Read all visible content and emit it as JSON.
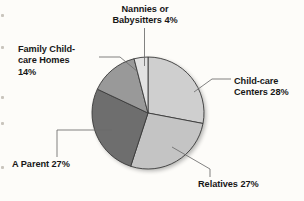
{
  "figure": {
    "background_color": "#fdfcf9",
    "text_color": "#171717",
    "slice_outline_color": "#3a3a3a",
    "leader_line_color": "#6b6b6b"
  },
  "labels": {
    "nannies": "Nannies or\nBabysitters 4%",
    "family_homes": "Family Child-\ncare Homes\n14%",
    "centers": "Child-care\nCenters 28%",
    "parent": "A Parent 27%",
    "relatives": "Relatives 27%"
  },
  "chart_data": {
    "type": "pie",
    "title": "",
    "subtitle": "",
    "xlabel": "",
    "ylabel": "",
    "legend": "none",
    "grid": false,
    "start_angle_deg": 0,
    "direction": "clockwise",
    "center": {
      "x": 148,
      "y": 113
    },
    "radius": 56,
    "labels": [
      "Child-care Centers",
      "Relatives",
      "A Parent",
      "Family Child-care Homes",
      "Nannies or Babysitters"
    ],
    "values": [
      28,
      27,
      27,
      14,
      4
    ],
    "value_unit": "percent",
    "data_labels": [
      "Child-care Centers 28%",
      "Relatives 27%",
      "A Parent 27%",
      "Family Child-care Homes 14%",
      "Nannies or Babysitters 4%"
    ],
    "slice_colors": [
      "#cfcfcf",
      "#c4c4c4",
      "#6e6e6e",
      "#999999",
      "#e2e2e2"
    ],
    "slices": [
      {
        "name": "Child-care Centers",
        "value": 28,
        "label": "Child-care Centers 28%",
        "color": "#cfcfcf",
        "start_deg": 0,
        "end_deg": 100.8
      },
      {
        "name": "Relatives",
        "value": 27,
        "label": "Relatives 27%",
        "color": "#c4c4c4",
        "start_deg": 100.8,
        "end_deg": 198.0
      },
      {
        "name": "A Parent",
        "value": 27,
        "label": "A Parent 27%",
        "color": "#6e6e6e",
        "start_deg": 198.0,
        "end_deg": 295.2
      },
      {
        "name": "Family Child-care Homes",
        "value": 14,
        "label": "Family Child-care Homes 14%",
        "color": "#999999",
        "start_deg": 295.2,
        "end_deg": 345.6
      },
      {
        "name": "Nannies or Babysitters",
        "value": 4,
        "label": "Nannies or Babysitters 4%",
        "color": "#e2e2e2",
        "start_deg": 345.6,
        "end_deg": 360.0
      }
    ]
  }
}
